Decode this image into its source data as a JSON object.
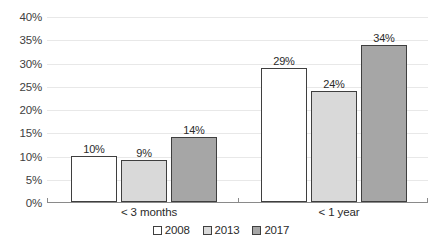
{
  "chart_data": {
    "type": "bar",
    "title": "",
    "subtitle": "",
    "xlabel": "",
    "ylabel": "",
    "categories": [
      "< 3 months",
      "< 1 year"
    ],
    "series": [
      {
        "name": "2008",
        "values": [
          10,
          29
        ],
        "color": "#ffffff"
      },
      {
        "name": "2013",
        "values": [
          9,
          24
        ],
        "color": "#d9d9d9"
      },
      {
        "name": "2017",
        "values": [
          14,
          34
        ],
        "color": "#a6a6a6"
      }
    ],
    "data_labels": [
      [
        "10%",
        "9%",
        "14%"
      ],
      [
        "29%",
        "24%",
        "34%"
      ]
    ],
    "ylim": [
      0,
      40
    ],
    "ytick_step": 5,
    "ytick_labels": [
      "40%",
      "35%",
      "30%",
      "25%",
      "20%",
      "15%",
      "10%",
      "5%",
      "0%"
    ],
    "ytick_values": [
      40,
      35,
      30,
      25,
      20,
      15,
      10,
      5,
      0
    ],
    "grid": true,
    "grid_axis": "y",
    "legend_position": "bottom-center",
    "bar_outline_color": "#3f3f3f",
    "grid_color": "#e8e8e8",
    "axis_color": "#8a8a8a",
    "text_color": "#2b2b2b",
    "background": "#ffffff"
  },
  "legend": {
    "items": [
      {
        "label": "2008"
      },
      {
        "label": "2013"
      },
      {
        "label": "2017"
      }
    ]
  }
}
